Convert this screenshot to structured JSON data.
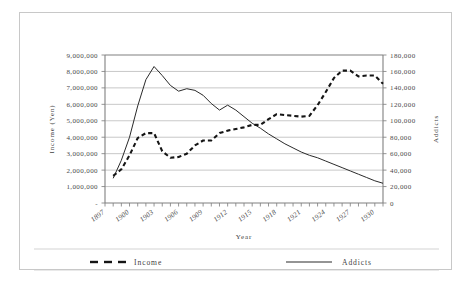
{
  "chart_data": {
    "type": "line",
    "title": "",
    "xlabel": "Year",
    "ylabel": "Income (Yen)",
    "ylabel_right": "Addicts",
    "grid": true,
    "legend_position": "bottom",
    "x": [
      1897,
      1898,
      1899,
      1900,
      1901,
      1902,
      1903,
      1904,
      1905,
      1906,
      1907,
      1908,
      1909,
      1910,
      1911,
      1912,
      1913,
      1914,
      1915,
      1916,
      1917,
      1918,
      1919,
      1920,
      1921,
      1922,
      1923,
      1924,
      1925,
      1926,
      1927,
      1928,
      1929,
      1930,
      1931
    ],
    "xlim": [
      1897,
      1931
    ],
    "xticks": [
      1897,
      1900,
      1903,
      1906,
      1909,
      1912,
      1915,
      1918,
      1921,
      1924,
      1927,
      1930
    ],
    "xticklabels": [
      "1897",
      "1900",
      "1903",
      "1906",
      "1909",
      "1912",
      "1915",
      "1918",
      "1921",
      "1924",
      "1927",
      "1930"
    ],
    "ylim": [
      0,
      9000000
    ],
    "yticks": [
      0,
      1000000,
      2000000,
      3000000,
      4000000,
      5000000,
      6000000,
      7000000,
      8000000,
      9000000
    ],
    "yticklabels": [
      "-",
      "1,000,000",
      "2,000,000",
      "3,000,000",
      "4,000,000",
      "5,000,000",
      "6,000,000",
      "7,000,000",
      "8,000,000",
      "9,000,000"
    ],
    "ylim_right": [
      0,
      180000
    ],
    "yticks_right": [
      0,
      20000,
      40000,
      60000,
      80000,
      100000,
      120000,
      140000,
      160000,
      180000
    ],
    "yticklabels_right": [
      "0",
      "20,000",
      "40,000",
      "60,000",
      "80,000",
      "100,000",
      "120,000",
      "140,000",
      "160,000",
      "180,000"
    ],
    "series": [
      {
        "name": "Income",
        "axis": "left",
        "style": "dashed",
        "color": "#151515",
        "values": [
          null,
          1650000,
          2050000,
          2900000,
          3950000,
          4250000,
          4250000,
          3150000,
          2750000,
          2800000,
          3000000,
          3500000,
          3800000,
          3800000,
          4250000,
          4400000,
          4500000,
          4600000,
          4750000,
          4750000,
          5100000,
          5400000,
          5350000,
          5300000,
          5250000,
          5300000,
          5950000,
          6750000,
          7600000,
          8050000,
          8050000,
          7700000,
          7750000,
          7750000,
          7250000
        ]
      },
      {
        "name": "Addicts",
        "axis": "right",
        "style": "solid",
        "color": "#2a2a2a",
        "values": [
          null,
          30000,
          52000,
          80000,
          118000,
          150000,
          166000,
          155000,
          143000,
          136000,
          139000,
          137000,
          131000,
          121000,
          113000,
          119000,
          113000,
          105000,
          97000,
          91000,
          84000,
          78000,
          72000,
          67000,
          62000,
          58000,
          55000,
          51000,
          47000,
          43000,
          39000,
          35000,
          31000,
          27000,
          24000
        ]
      }
    ],
    "extra_income_tail": {
      "note": "after 1927 income declines",
      "values_1928_1931": [
        8050000,
        7700000,
        8100000,
        7700000
      ]
    }
  },
  "axes": {
    "left_title": "Income (Yen)",
    "right_title": "Addicts",
    "bottom_title": "Year"
  },
  "legend": {
    "items": [
      {
        "label": "Income",
        "style": "dashed"
      },
      {
        "label": "Addicts",
        "style": "solid"
      }
    ]
  }
}
